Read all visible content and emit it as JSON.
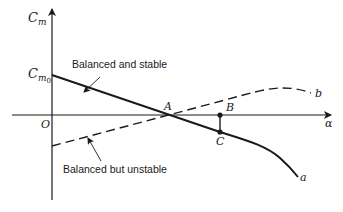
{
  "diagram": {
    "axes": {
      "y_label_main": "C",
      "y_label_sub": "m",
      "x_label": "α",
      "origin_label": "O",
      "intercept_label_main": "C",
      "intercept_label_sub": "m",
      "intercept_label_sub2": "0"
    },
    "curves": [
      {
        "name": "a",
        "label": "a",
        "style": "solid",
        "description": "Balanced and stable"
      },
      {
        "name": "b",
        "label": "b",
        "style": "dashed",
        "description": "Balanced but unstable"
      }
    ],
    "points": {
      "A": "A",
      "B": "B",
      "C": "C"
    },
    "annotations": {
      "stable": "Balanced and stable",
      "unstable": "Balanced but unstable"
    },
    "colors": {
      "ink": "#1a1a1a",
      "background": "#ffffff"
    }
  }
}
